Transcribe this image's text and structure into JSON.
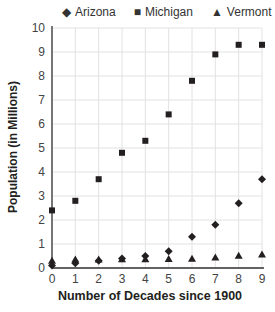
{
  "chart_data": {
    "type": "scatter",
    "title": "",
    "xlabel": "Number of Decades since 1900",
    "ylabel": "Population (in Millions)",
    "x": [
      0,
      1,
      2,
      3,
      4,
      5,
      6,
      7,
      8,
      9
    ],
    "xlim": [
      0,
      9
    ],
    "ylim": [
      0,
      10
    ],
    "x_ticks": [
      0,
      1,
      2,
      3,
      4,
      5,
      6,
      7,
      8,
      9
    ],
    "y_ticks": [
      0,
      1,
      2,
      3,
      4,
      5,
      6,
      7,
      8,
      9,
      10
    ],
    "grid": true,
    "legend_position": "top",
    "series": [
      {
        "name": "Arizona",
        "marker": "diamond",
        "values": [
          0.1,
          0.2,
          0.3,
          0.4,
          0.5,
          0.7,
          1.3,
          1.8,
          2.7,
          3.7
        ]
      },
      {
        "name": "Michigan",
        "marker": "square",
        "values": [
          2.4,
          2.8,
          3.7,
          4.8,
          5.3,
          6.4,
          7.8,
          8.9,
          9.3,
          9.3
        ]
      },
      {
        "name": "Vermont",
        "marker": "triangle",
        "values": [
          0.3,
          0.35,
          0.35,
          0.36,
          0.36,
          0.38,
          0.39,
          0.44,
          0.51,
          0.56
        ]
      }
    ]
  },
  "legend": {
    "arizona": "Arizona",
    "michigan": "Michigan",
    "vermont": "Vermont"
  },
  "axes": {
    "xlabel": "Number of Decades since 1900",
    "ylabel": "Population (in Millions)"
  }
}
